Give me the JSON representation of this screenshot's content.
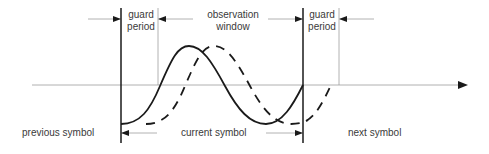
{
  "diagram": {
    "type": "guard-period-timing",
    "labels": {
      "guard_left_line1": "guard",
      "guard_left_line2": "period",
      "observation_line1": "observation",
      "observation_line2": "window",
      "guard_right_line1": "guard",
      "guard_right_line2": "period",
      "previous_symbol": "previous symbol",
      "current_symbol": "current symbol",
      "next_symbol": "next symbol"
    },
    "curves": [
      {
        "name": "direct-path-signal",
        "style": "solid"
      },
      {
        "name": "delayed-multipath-signal",
        "style": "dashed"
      }
    ],
    "colors": {
      "stroke": "#1a1a1a",
      "thin_line": "#9a9a9a",
      "text": "#3a3a3a"
    }
  }
}
